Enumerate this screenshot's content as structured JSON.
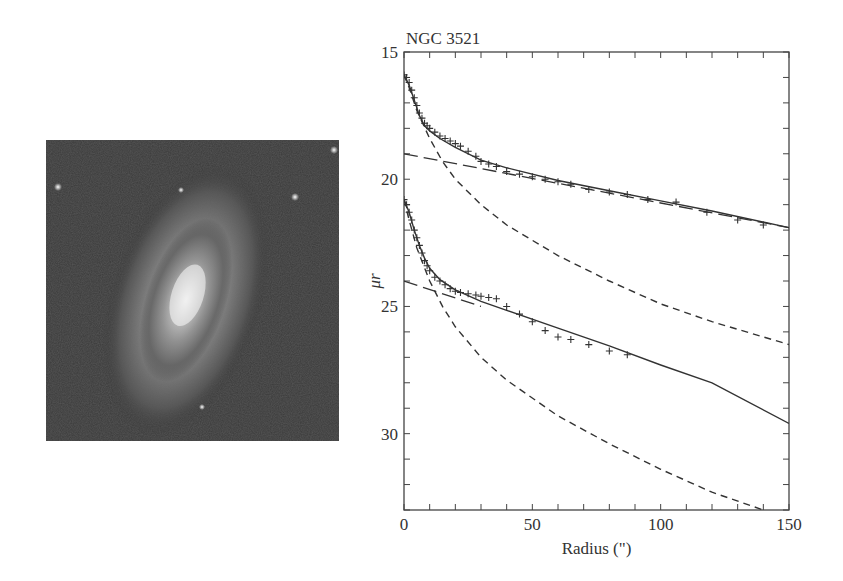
{
  "figure": {
    "image_panel": {
      "description": "galaxy image NGC 3521",
      "icon": "galaxy-image"
    },
    "plot_title": "NGC 3521"
  },
  "chart_data": {
    "type": "line",
    "title": "NGC 3521",
    "xlabel": "Radius (\")",
    "ylabel": "μr",
    "xlim": [
      0,
      150
    ],
    "ylim": [
      33,
      15
    ],
    "y_inverted": true,
    "xticks": [
      0,
      50,
      100,
      150
    ],
    "yticks": [
      15,
      20,
      25,
      30
    ],
    "x_minor_step": 10,
    "y_minor_step": 1,
    "grid": false,
    "series": [
      {
        "name": "profile upper (data)",
        "style": "plus-markers",
        "x": [
          0,
          1,
          2,
          3,
          4,
          5,
          6,
          7,
          8,
          9,
          10,
          12,
          14,
          16,
          18,
          20,
          22,
          25,
          28,
          30,
          33,
          36,
          40,
          45,
          50,
          55,
          60,
          65,
          72,
          80,
          87,
          95,
          106,
          118,
          130,
          140
        ],
        "y": [
          15.9,
          16.0,
          16.2,
          16.5,
          16.8,
          17.1,
          17.4,
          17.6,
          17.8,
          17.9,
          18.0,
          18.15,
          18.3,
          18.4,
          18.5,
          18.6,
          18.7,
          18.9,
          19.1,
          19.3,
          19.4,
          19.5,
          19.7,
          19.8,
          19.9,
          20.0,
          20.1,
          20.2,
          20.4,
          20.5,
          20.6,
          20.8,
          20.9,
          21.3,
          21.6,
          21.8
        ]
      },
      {
        "name": "upper total fit",
        "style": "solid",
        "x": [
          0,
          2,
          4,
          6,
          8,
          10,
          14,
          20,
          30,
          40,
          60,
          80,
          100,
          120,
          150
        ],
        "y": [
          15.9,
          16.3,
          16.9,
          17.5,
          17.9,
          18.1,
          18.4,
          18.75,
          19.25,
          19.55,
          20.05,
          20.45,
          20.85,
          21.25,
          21.9
        ]
      },
      {
        "name": "upper bulge component",
        "style": "dashed",
        "x": [
          0,
          2,
          5,
          10,
          15,
          20,
          30,
          40,
          60,
          80,
          100,
          120,
          150
        ],
        "y": [
          15.9,
          16.4,
          17.3,
          18.4,
          19.3,
          20.0,
          21.0,
          21.8,
          23.0,
          24.0,
          24.9,
          25.6,
          26.5
        ]
      },
      {
        "name": "upper disk component",
        "style": "long-dash",
        "x": [
          0,
          150
        ],
        "y": [
          19.0,
          21.9
        ]
      },
      {
        "name": "profile lower (data)",
        "style": "plus-markers",
        "x": [
          0,
          1,
          2,
          3,
          4,
          5,
          6,
          7,
          8,
          9,
          10,
          12,
          14,
          16,
          18,
          20,
          22,
          25,
          28,
          30,
          33,
          36,
          40,
          45,
          50,
          55,
          60,
          65,
          72,
          80,
          87
        ],
        "y": [
          20.8,
          21.0,
          21.3,
          21.6,
          22.0,
          22.3,
          22.6,
          22.9,
          23.2,
          23.4,
          23.6,
          23.85,
          24.0,
          24.15,
          24.3,
          24.4,
          24.45,
          24.5,
          24.55,
          24.6,
          24.65,
          24.7,
          25.0,
          25.3,
          25.6,
          25.95,
          26.2,
          26.3,
          26.5,
          26.75,
          26.9
        ]
      },
      {
        "name": "lower total fit",
        "style": "solid",
        "x": [
          0,
          2,
          4,
          6,
          8,
          10,
          14,
          20,
          30,
          40,
          60,
          80,
          100,
          120,
          150
        ],
        "y": [
          20.8,
          21.3,
          22.0,
          22.6,
          23.1,
          23.5,
          23.95,
          24.35,
          24.8,
          25.15,
          25.85,
          26.55,
          27.3,
          28.0,
          29.6
        ]
      },
      {
        "name": "lower bulge component",
        "style": "dashed",
        "x": [
          0,
          2,
          5,
          10,
          15,
          20,
          30,
          40,
          60,
          80,
          100,
          120,
          140
        ],
        "y": [
          20.8,
          21.6,
          22.7,
          24.0,
          25.0,
          25.8,
          27.0,
          27.9,
          29.3,
          30.4,
          31.4,
          32.3,
          33.0
        ]
      },
      {
        "name": "lower disk component",
        "style": "long-dash",
        "x": [
          0,
          30
        ],
        "y": [
          24.0,
          25.0
        ]
      }
    ]
  }
}
